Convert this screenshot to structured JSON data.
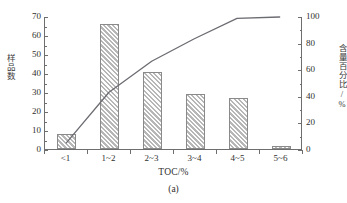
{
  "figure": {
    "caption": "(a)",
    "xlabel": "TOC/%",
    "ylabel_left": "样品数",
    "ylabel_right": "含量百分比/%"
  },
  "axes": {
    "left_ticks": [
      "0",
      "10",
      "20",
      "30",
      "40",
      "50",
      "60",
      "70"
    ],
    "right_ticks": [
      "0",
      "20",
      "40",
      "60",
      "80",
      "100"
    ],
    "left_min": 0,
    "left_max": 70,
    "right_min": 0,
    "right_max": 100
  },
  "colors": {
    "bar_fill": "#dcdcdc",
    "bar_hatch": "#b0b0b0",
    "bar_border": "#8a8a8a",
    "line": "#6b6b72",
    "axis": "#6e6e6e",
    "text": "#2f2f2f",
    "background": "#ffffff"
  },
  "chart_data": {
    "type": "bar",
    "title": "",
    "subtitle": "",
    "xlabel": "TOC/%",
    "ylabel": "样品数",
    "y2label": "含量百分比/%",
    "categories": [
      "<1",
      "1~2",
      "2~3",
      "3~4",
      "4~5",
      "5~6"
    ],
    "ylim": [
      0,
      70
    ],
    "y2lim": [
      0,
      100
    ],
    "ytick_step": 10,
    "y2tick_step": 20,
    "grid": false,
    "legend": "none",
    "series": [
      {
        "name": "样品数",
        "type": "bar",
        "axis": "left",
        "values": [
          8,
          66,
          40.5,
          29,
          27,
          1.8
        ]
      },
      {
        "name": "含量百分比/%",
        "type": "line",
        "axis": "right",
        "values": [
          4.7,
          43.0,
          66.5,
          83.5,
          99.0,
          100.0
        ]
      }
    ]
  }
}
